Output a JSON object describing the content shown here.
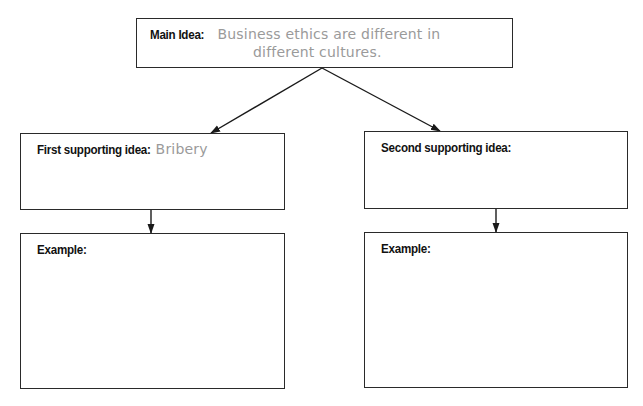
{
  "diagram": {
    "type": "main-idea-organizer",
    "main_idea": {
      "label": "Main Idea:",
      "answer_line1": "Business ethics are different in",
      "answer_line2": "different cultures."
    },
    "supporting_ideas": [
      {
        "label": "First supporting idea:",
        "answer": "Bribery",
        "example": {
          "label": "Example:",
          "answer": ""
        }
      },
      {
        "label": "Second supporting idea:",
        "answer": "",
        "example": {
          "label": "Example:",
          "answer": ""
        }
      }
    ],
    "colors": {
      "border": "#2a2a2a",
      "label_text": "#111111",
      "handwritten_text": "#9a9a9a",
      "background": "#ffffff"
    }
  }
}
